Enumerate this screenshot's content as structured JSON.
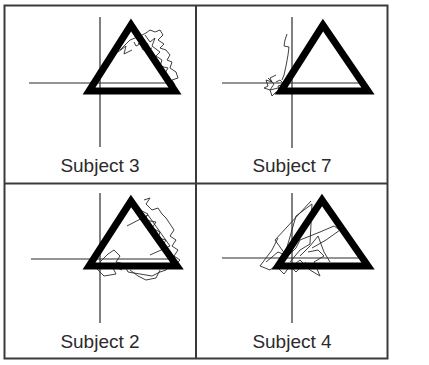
{
  "figure": {
    "layout": "2x2 grid",
    "colors": {
      "frame": "#3a3a3a",
      "triangle": "#000000",
      "axes": "#2a2a2a",
      "trace": "#2a2a2a"
    },
    "panels": [
      {
        "id": "p1",
        "label": "Subject 3",
        "position": "top-left"
      },
      {
        "id": "p2",
        "label": "Subject 7",
        "position": "top-right"
      },
      {
        "id": "p3",
        "label": "Subject 2",
        "position": "bottom-left"
      },
      {
        "id": "p4",
        "label": "Subject 4",
        "position": "bottom-right"
      }
    ]
  }
}
